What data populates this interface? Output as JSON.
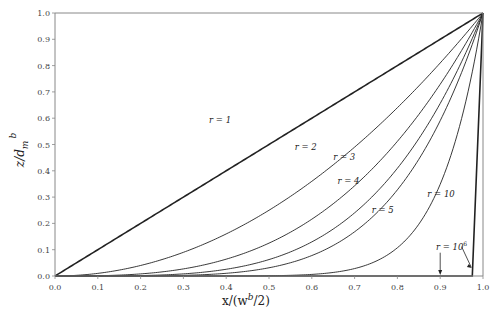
{
  "chart_data": {
    "type": "line",
    "title": "",
    "xlabel": "x/(w^b/2)",
    "ylabel": "z/d_m^b",
    "xlim": [
      0,
      1
    ],
    "ylim": [
      0,
      1
    ],
    "xticks": [
      "0.0",
      "0.1",
      "0.2",
      "0.3",
      "0.4",
      "0.5",
      "0.6",
      "0.7",
      "0.8",
      "0.9",
      "1.0"
    ],
    "yticks": [
      "0.0",
      "0.1",
      "0.2",
      "0.3",
      "0.4",
      "0.5",
      "0.6",
      "0.7",
      "0.8",
      "0.9",
      "1.0"
    ],
    "grid": false,
    "legend": "inline labels",
    "function": "z = x^r",
    "series": [
      {
        "name": "r = 1",
        "exponent": 1,
        "x": [
          0,
          0.5,
          1
        ],
        "values": [
          0,
          0.5,
          1
        ]
      },
      {
        "name": "r = 2",
        "exponent": 2,
        "x": [
          0,
          0.25,
          0.5,
          0.75,
          1
        ],
        "values": [
          0,
          0.0625,
          0.25,
          0.5625,
          1
        ]
      },
      {
        "name": "r = 3",
        "exponent": 3,
        "x": [
          0,
          0.25,
          0.5,
          0.75,
          1
        ],
        "values": [
          0,
          0.0156,
          0.125,
          0.4219,
          1
        ]
      },
      {
        "name": "r = 4",
        "exponent": 4,
        "x": [
          0,
          0.25,
          0.5,
          0.75,
          1
        ],
        "values": [
          0,
          0.0039,
          0.0625,
          0.3164,
          1
        ]
      },
      {
        "name": "r = 5",
        "exponent": 5,
        "x": [
          0,
          0.25,
          0.5,
          0.75,
          1
        ],
        "values": [
          0,
          0.001,
          0.0313,
          0.2373,
          1
        ]
      },
      {
        "name": "r = 10",
        "exponent": 10,
        "x": [
          0,
          0.5,
          0.75,
          0.9,
          1
        ],
        "values": [
          0,
          0.001,
          0.0563,
          0.3487,
          1
        ]
      },
      {
        "name": "r = 10^6",
        "exponent": 1000000,
        "x": [
          0,
          0.975,
          1
        ],
        "values": [
          0,
          0,
          1
        ]
      }
    ],
    "annotations": [
      {
        "text": "r = 1",
        "x": 0.36,
        "y": 0.58
      },
      {
        "text": "r = 2",
        "x": 0.56,
        "y": 0.48
      },
      {
        "text": "r = 3",
        "x": 0.65,
        "y": 0.44
      },
      {
        "text": "r = 4",
        "x": 0.66,
        "y": 0.35
      },
      {
        "text": "r = 5",
        "x": 0.74,
        "y": 0.24
      },
      {
        "text": "r = 10",
        "x": 0.87,
        "y": 0.3
      },
      {
        "text": "r = 10^6",
        "x": 0.89,
        "y": 0.1,
        "arrows_to": [
          [
            0.9,
            0.0
          ],
          [
            0.975,
            0.03
          ]
        ]
      }
    ]
  },
  "labels": {
    "xlabel_main": "x/(w",
    "xlabel_sup": "b",
    "xlabel_tail": "/2)",
    "ylabel_main": "z/d",
    "ylabel_sub": "m",
    "ylabel_sup": "b"
  }
}
